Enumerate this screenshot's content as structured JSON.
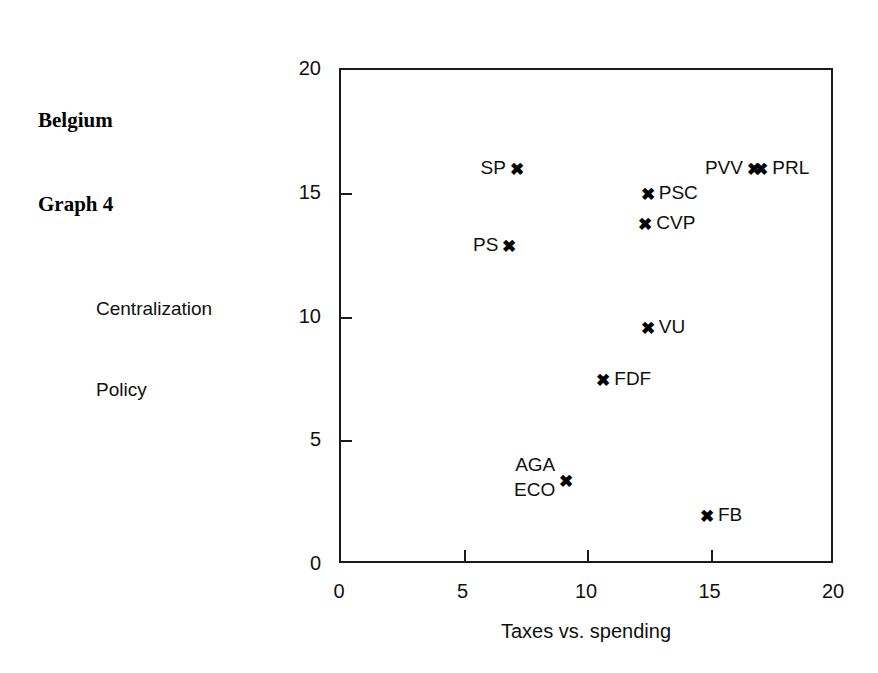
{
  "figure": {
    "title_lines": [
      "Belgium",
      "Graph 4"
    ]
  },
  "chart_data": {
    "type": "scatter",
    "title": "Belgium Graph 4",
    "xlabel": "Taxes vs. spending",
    "ylabel": "Centralization Policy",
    "ylabel_lines": [
      "Centralization",
      "Policy"
    ],
    "xlim": [
      0,
      20
    ],
    "ylim": [
      0,
      20
    ],
    "xticks": [
      0,
      5,
      10,
      15,
      20
    ],
    "yticks": [
      0,
      5,
      10,
      15,
      20
    ],
    "xtick_labels": [
      "0",
      "5",
      "10",
      "15",
      "20"
    ],
    "ytick_labels": [
      "0",
      "5",
      "10",
      "15",
      "20"
    ],
    "grid": false,
    "legend": "none",
    "marker": "x",
    "points": [
      {
        "label": "SP",
        "x": 7.2,
        "y": 15.9,
        "label_side": "left"
      },
      {
        "label": "PS",
        "x": 6.9,
        "y": 12.8,
        "label_side": "left"
      },
      {
        "label": "PSC",
        "x": 12.5,
        "y": 14.9,
        "label_side": "right"
      },
      {
        "label": "CVP",
        "x": 12.4,
        "y": 13.7,
        "label_side": "right"
      },
      {
        "label": "PVV",
        "x": 16.8,
        "y": 15.9,
        "label_side": "left"
      },
      {
        "label": "PRL",
        "x": 17.1,
        "y": 15.9,
        "label_side": "right"
      },
      {
        "label": "VU",
        "x": 12.5,
        "y": 9.5,
        "label_side": "right"
      },
      {
        "label": "FDF",
        "x": 10.7,
        "y": 7.4,
        "label_side": "right"
      },
      {
        "label": "AGA ECO",
        "x": 9.2,
        "y": 3.3,
        "label_side": "left",
        "label_lines": [
          "AGA",
          "ECO"
        ]
      },
      {
        "label": "FB",
        "x": 14.9,
        "y": 1.9,
        "label_side": "right"
      }
    ]
  },
  "style": {
    "axis_color": "#1a1a1a",
    "text_color": "#101010",
    "marker_color": "#000000",
    "background": "#ffffff",
    "marker_glyph": "✖"
  }
}
